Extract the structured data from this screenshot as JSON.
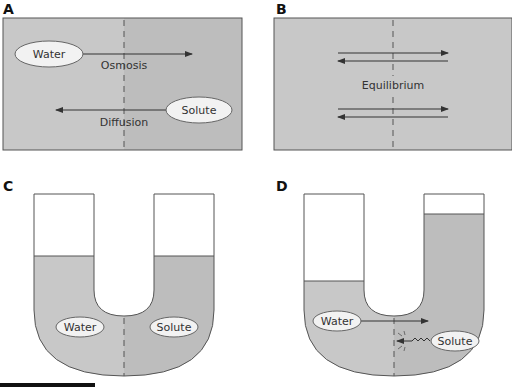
{
  "panels": {
    "a": {
      "letter": "A",
      "water_label": "Water",
      "osmosis_label": "Osmosis",
      "solute_label": "Solute",
      "diffusion_label": "Diffusion"
    },
    "b": {
      "letter": "B",
      "equilibrium_label": "Equilibrium"
    },
    "c": {
      "letter": "C",
      "water_label": "Water",
      "solute_label": "Solute"
    },
    "d": {
      "letter": "D",
      "water_label": "Water",
      "solute_label": "Solute"
    }
  },
  "colors": {
    "fill_left": "#c8c8c8",
    "fill_right": "#bdbdbd",
    "outline": "#555555",
    "label_bg": "#f2f2f2"
  }
}
